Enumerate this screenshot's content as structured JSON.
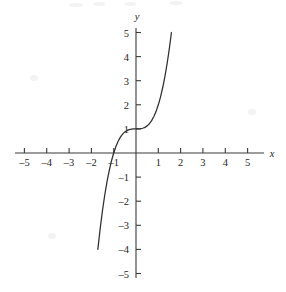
{
  "chart_data": {
    "type": "line",
    "title": "",
    "subtitle": "",
    "xlabel": "x",
    "ylabel": "y",
    "xlim": [
      -5,
      5
    ],
    "ylim": [
      -5,
      5
    ],
    "grid": false,
    "legend": null,
    "legend_position": "none",
    "x_ticks": [
      -5,
      -4,
      -3,
      -2,
      -1,
      1,
      2,
      3,
      4,
      5
    ],
    "y_ticks": [
      -5,
      -4,
      -3,
      -2,
      -1,
      1,
      2,
      3,
      4,
      5
    ],
    "x_tick_labels": [
      "–5",
      "–4",
      "–3",
      "–2",
      "–1",
      "1",
      "2",
      "3",
      "4",
      "5"
    ],
    "y_tick_labels": [
      "–5",
      "–4",
      "–3",
      "–2",
      "–1",
      "1",
      "2",
      "3",
      "4",
      "5"
    ],
    "series": [
      {
        "name": "y = x³ + 1",
        "equation": "y = x^3 + 1",
        "x_range": [
          -1.71,
          1.587
        ],
        "x": [
          -1.71,
          -1.6,
          -1.5,
          -1.4,
          -1.3,
          -1.2,
          -1.1,
          -1.0,
          -0.9,
          -0.8,
          -0.7,
          -0.6,
          -0.5,
          -0.4,
          -0.3,
          -0.2,
          -0.1,
          0.0,
          0.1,
          0.2,
          0.3,
          0.4,
          0.5,
          0.6,
          0.7,
          0.8,
          0.9,
          1.0,
          1.1,
          1.2,
          1.3,
          1.4,
          1.5,
          1.587
        ],
        "values": [
          -4.0,
          -3.096,
          -2.375,
          -1.744,
          -1.197,
          -0.728,
          -0.331,
          0.0,
          0.271,
          0.488,
          0.657,
          0.784,
          0.875,
          0.936,
          0.973,
          0.992,
          0.999,
          1.0,
          1.001,
          1.008,
          1.027,
          1.064,
          1.125,
          1.216,
          1.343,
          1.512,
          1.729,
          2.0,
          2.331,
          2.728,
          3.197,
          3.744,
          4.375,
          5.0
        ]
      }
    ],
    "key_points": [
      {
        "label": "root",
        "x": -1,
        "y": 0
      },
      {
        "label": "y-intercept / inflection",
        "x": 0,
        "y": 1
      }
    ],
    "annotations": []
  },
  "axes": {
    "x_axis_label": "x",
    "y_axis_label": "y"
  }
}
